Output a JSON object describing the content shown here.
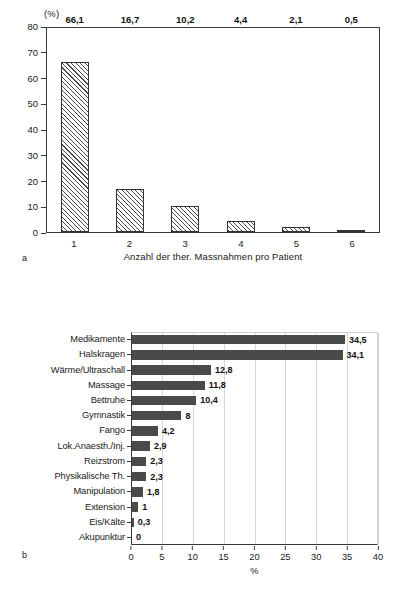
{
  "figure": {
    "panel_a_letter": "a",
    "panel_b_letter": "b"
  },
  "chart_data": [
    {
      "id": "a",
      "type": "bar",
      "orientation": "vertical",
      "title": "",
      "xlabel": "Anzahl der ther. Massnahmen pro Patient",
      "ylabel": "(%)",
      "ylim": [
        0,
        80
      ],
      "yticks": [
        0,
        10,
        20,
        30,
        40,
        50,
        60,
        70,
        80
      ],
      "ytick_labels": [
        "0",
        "10",
        "20",
        "30",
        "40",
        "50",
        "60",
        "70",
        "80"
      ],
      "categories": [
        "1",
        "2",
        "3",
        "4",
        "5",
        "6"
      ],
      "values": [
        66.1,
        16.7,
        10.2,
        4.4,
        2.1,
        0.5
      ],
      "value_labels": [
        "66,1",
        "16,7",
        "10,2",
        "4,4",
        "2,1",
        "0,5"
      ],
      "grid": false,
      "legend": null,
      "bar_style": "diagonal-hatch",
      "bar_color": "#4a4a4a"
    },
    {
      "id": "b",
      "type": "bar",
      "orientation": "horizontal",
      "title": "",
      "xlabel": "%",
      "ylabel": "",
      "xlim": [
        0,
        40
      ],
      "xticks": [
        0,
        5,
        10,
        15,
        20,
        25,
        30,
        35,
        40
      ],
      "xtick_labels": [
        "0",
        "5",
        "10",
        "15",
        "20",
        "25",
        "30",
        "35",
        "40"
      ],
      "categories": [
        "Medikamente",
        "Halskragen",
        "Wärme/Ultraschall",
        "Massage",
        "Bettruhe",
        "Gymnastik",
        "Fango",
        "Lok.Anaesth./Inj.",
        "Reizstrom",
        "Physikalische Th.",
        "Manipulation",
        "Extension",
        "Eis/Kälte",
        "Akupunktur"
      ],
      "values": [
        34.5,
        34.1,
        12.8,
        11.8,
        10.4,
        8,
        4.2,
        2.9,
        2.3,
        2.3,
        1.8,
        1,
        0.3,
        0
      ],
      "value_labels": [
        "34,5",
        "34,1",
        "12,8",
        "11,8",
        "10,4",
        "8",
        "4,2",
        "2,9",
        "2,3",
        "2,3",
        "1,8",
        "1",
        "0,3",
        "0"
      ],
      "grid": true,
      "legend": null,
      "bar_style": "solid",
      "bar_color": "#4a4a4a"
    }
  ]
}
